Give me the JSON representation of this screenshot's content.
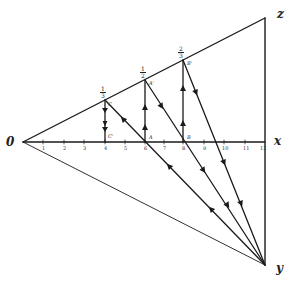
{
  "diagram": {
    "vertices": {
      "O": "0",
      "X": "x",
      "Z": "z",
      "Y": "y"
    },
    "axis_ticks": [
      "1",
      "2",
      "3",
      "4",
      "5",
      "6",
      "7",
      "8",
      "9",
      "10",
      "11",
      "12"
    ],
    "fractions": [
      {
        "num": "1",
        "den": "3"
      },
      {
        "num": "1",
        "den": "2"
      },
      {
        "num": "2",
        "den": "3"
      }
    ],
    "points": {
      "C_prime_upper": "C",
      "A_prime": "A'",
      "B_prime": "B'",
      "C_prime_lower": "C'",
      "A": "A",
      "B": "B"
    },
    "stroke_color": "#1a1a1a"
  }
}
